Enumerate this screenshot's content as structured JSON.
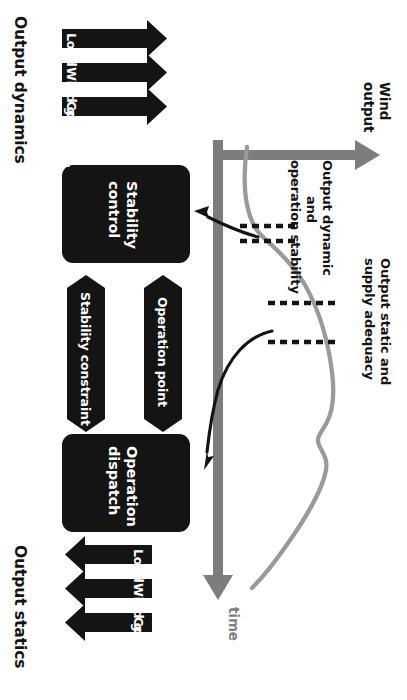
{
  "diagram": {
    "orientation": "rotated-90",
    "sections": {
      "top_label": "Output dynamics",
      "bottom_label": "Output statics"
    },
    "boxes": [
      {
        "id": "stability-control",
        "label_line1": "Stability",
        "label_line2": "control"
      },
      {
        "id": "operation-dispatch",
        "label_line1": "Operation",
        "label_line2": "dispatch"
      }
    ],
    "input_arrows_top": [
      {
        "label": "Load"
      },
      {
        "label": "Wind gen."
      },
      {
        "label": "Con. Gen."
      }
    ],
    "input_arrows_bottom": [
      {
        "label": "Load"
      },
      {
        "label": "Wind gen."
      },
      {
        "label": "Con. Gen."
      }
    ],
    "middle_arrows": [
      {
        "label": "Stability constraint",
        "direction": "down"
      },
      {
        "label": "Operation point",
        "direction": "up"
      }
    ],
    "chart": {
      "x_axis_label_line1": "Wind",
      "x_axis_label_line2": "output",
      "y_axis_label": "time",
      "annotation_dynamic_line1": "Output dynamic",
      "annotation_dynamic_line2": "and",
      "annotation_dynamic_line3": "operation stability",
      "annotation_static_line1": "Output static and",
      "annotation_static_line2": "supply adequacy"
    }
  },
  "colors": {
    "black": "#141414",
    "gray": "#7d7d7d",
    "white": "#ffffff"
  }
}
